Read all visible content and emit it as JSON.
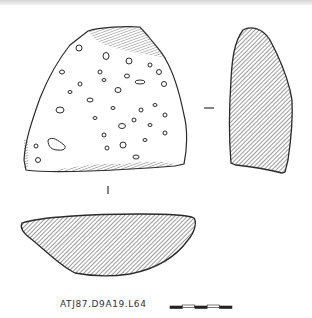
{
  "figure": {
    "catalog_label": "ATJ87.D9A19.L64",
    "views": [
      {
        "name": "exterior-face",
        "description": "Sherd exterior with inclusions/voids"
      },
      {
        "name": "side-section",
        "description": "Cross-section profile (hatched)"
      },
      {
        "name": "bottom-section",
        "description": "Horizontal section profile (hatched)"
      }
    ],
    "scale_bar": {
      "segments": 5,
      "pattern": [
        "black",
        "white",
        "black",
        "white",
        "black"
      ]
    },
    "ink_color": "#2a2a2a",
    "hatch_color": "#3a3a3a"
  }
}
